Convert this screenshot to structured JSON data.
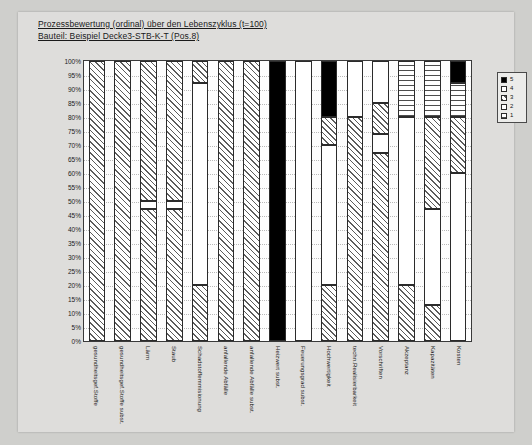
{
  "document": {
    "title_line_1": "Prozessbewertung (ordinal) über den Lebenszyklus (t=100)",
    "title_line_2": "Bauteil: Beispiel Decke3-STB-K-T (Pos.8)"
  },
  "legend": {
    "title": "",
    "items": [
      {
        "label": "5",
        "key": "f5"
      },
      {
        "label": "4",
        "key": "f4"
      },
      {
        "label": "3",
        "key": "f3"
      },
      {
        "label": "2",
        "key": "f2"
      },
      {
        "label": "1",
        "key": "f1"
      }
    ]
  },
  "chart_data": {
    "type": "bar",
    "subtype": "stacked-100-percent",
    "title": "Prozessbewertung (ordinal) über den Lebenszyklus (t=100)",
    "subtitle": "Bauteil: Beispiel Decke3-STB-K-T (Pos.8)",
    "xlabel": "",
    "ylabel": "",
    "ylim": [
      0,
      100
    ],
    "grid": true,
    "legend_position": "right",
    "ytick_labels": [
      "100%",
      "95%",
      "90%",
      "85%",
      "80%",
      "75%",
      "70%",
      "65%",
      "60%",
      "55%",
      "50%",
      "45%",
      "40%",
      "35%",
      "30%",
      "25%",
      "20%",
      "15%",
      "10%",
      "5%",
      "0%"
    ],
    "ytick_values": [
      100,
      95,
      90,
      85,
      80,
      75,
      70,
      65,
      60,
      55,
      50,
      45,
      40,
      35,
      30,
      25,
      20,
      15,
      10,
      5,
      0
    ],
    "categories": [
      "gesundheitsgef.Stoffe",
      "gesundheitsgef.Stoffe subst.",
      "Lärm",
      "Staub",
      "Schadstoffemmisionung",
      "anfallende Abfälle",
      "anfallende Abfälle subst.",
      "Heizwert subst.",
      "Feuerungsgrad subst.",
      "Hochwertigkeit",
      "techn.Realisierbarkeit",
      "Vorschriften",
      "Akzeptanz",
      "Kapazitäten",
      "Kosten"
    ],
    "series": [
      {
        "name": "1",
        "key": "f1",
        "values": [
          0,
          0,
          0,
          0,
          0,
          0,
          0,
          0,
          0,
          0,
          0,
          20,
          20,
          20,
          20
        ]
      },
      {
        "name": "2",
        "key": "f2",
        "values": [
          0,
          0,
          0,
          0,
          0,
          0,
          0,
          0,
          0,
          0,
          0,
          0,
          0,
          0,
          0
        ]
      },
      {
        "name": "3",
        "key": "f3",
        "values": [
          100,
          100,
          47,
          47,
          20,
          100,
          100,
          0,
          0,
          20,
          80,
          7,
          0,
          0,
          0
        ]
      },
      {
        "name": "4",
        "key": "f4",
        "values": [
          0,
          0,
          3,
          3,
          72,
          0,
          0,
          0,
          100,
          50,
          0,
          5,
          60,
          47,
          47
        ]
      },
      {
        "name": "5",
        "key": "f5",
        "values": [
          0,
          0,
          0,
          0,
          0,
          0,
          0,
          100,
          0,
          20,
          0,
          0,
          0,
          0,
          8
        ]
      }
    ],
    "stacks": [
      {
        "category": "gesundheitsgef.Stoffe",
        "segments": [
          {
            "key": "f3",
            "from": 0,
            "to": 100
          }
        ]
      },
      {
        "category": "gesundheitsgef.Stoffe subst.",
        "segments": [
          {
            "key": "f3",
            "from": 0,
            "to": 100
          }
        ]
      },
      {
        "category": "Lärm",
        "segments": [
          {
            "key": "f3",
            "from": 0,
            "to": 47
          },
          {
            "key": "f4",
            "from": 47,
            "to": 50
          },
          {
            "key": "f3",
            "from": 50,
            "to": 100
          }
        ]
      },
      {
        "category": "Staub",
        "segments": [
          {
            "key": "f3",
            "from": 0,
            "to": 47
          },
          {
            "key": "f4",
            "from": 47,
            "to": 50
          },
          {
            "key": "f3",
            "from": 50,
            "to": 100
          }
        ]
      },
      {
        "category": "Schadstoffemmisionung",
        "segments": [
          {
            "key": "f3",
            "from": 0,
            "to": 20
          },
          {
            "key": "f4",
            "from": 20,
            "to": 92
          },
          {
            "key": "f3",
            "from": 92,
            "to": 100
          }
        ]
      },
      {
        "category": "anfallende Abfälle",
        "segments": [
          {
            "key": "f3",
            "from": 0,
            "to": 100
          }
        ]
      },
      {
        "category": "anfallende Abfälle subst.",
        "segments": [
          {
            "key": "f3",
            "from": 0,
            "to": 100
          }
        ]
      },
      {
        "category": "Heizwert subst.",
        "segments": [
          {
            "key": "f5",
            "from": 0,
            "to": 100
          }
        ]
      },
      {
        "category": "Feuerungsgrad subst.",
        "segments": [
          {
            "key": "f4",
            "from": 0,
            "to": 100
          }
        ]
      },
      {
        "category": "Hochwertigkeit",
        "segments": [
          {
            "key": "f3",
            "from": 0,
            "to": 20
          },
          {
            "key": "f4",
            "from": 20,
            "to": 70
          },
          {
            "key": "f3",
            "from": 70,
            "to": 80
          },
          {
            "key": "f5",
            "from": 80,
            "to": 100
          }
        ]
      },
      {
        "category": "techn.Realisierbarkeit",
        "segments": [
          {
            "key": "f3",
            "from": 0,
            "to": 80
          },
          {
            "key": "f4",
            "from": 80,
            "to": 100
          }
        ]
      },
      {
        "category": "Vorschriften",
        "segments": [
          {
            "key": "f3",
            "from": 0,
            "to": 67
          },
          {
            "key": "f4",
            "from": 67,
            "to": 74
          },
          {
            "key": "f3",
            "from": 74,
            "to": 85
          },
          {
            "key": "f4",
            "from": 85,
            "to": 100
          }
        ]
      },
      {
        "category": "Akzeptanz",
        "segments": [
          {
            "key": "f3",
            "from": 0,
            "to": 20
          },
          {
            "key": "f4",
            "from": 20,
            "to": 80
          },
          {
            "key": "f1",
            "from": 80,
            "to": 100
          }
        ]
      },
      {
        "category": "Kapazitäten",
        "segments": [
          {
            "key": "f3",
            "from": 0,
            "to": 13
          },
          {
            "key": "f4",
            "from": 13,
            "to": 47
          },
          {
            "key": "f3",
            "from": 47,
            "to": 80
          },
          {
            "key": "f1",
            "from": 80,
            "to": 100
          }
        ]
      },
      {
        "category": "Kosten",
        "segments": [
          {
            "key": "f4",
            "from": 0,
            "to": 60
          },
          {
            "key": "f3",
            "from": 60,
            "to": 80
          },
          {
            "key": "f1",
            "from": 80,
            "to": 92
          },
          {
            "key": "f5",
            "from": 92,
            "to": 100
          }
        ]
      }
    ]
  }
}
